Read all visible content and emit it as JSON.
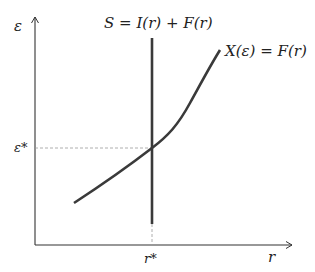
{
  "diagram": {
    "colors": {
      "axis": "#333333",
      "curve": "#3a3a3a",
      "dashed": "#999999",
      "background": "#ffffff"
    },
    "axes": {
      "y_label": "ε",
      "x_label": "r"
    },
    "vertical_line": {
      "label": "S = I(r) + F(r)"
    },
    "curve": {
      "label": "X(ε) = F(r)"
    },
    "equilibrium": {
      "y_tick": "ε*",
      "x_tick": "r*"
    }
  }
}
